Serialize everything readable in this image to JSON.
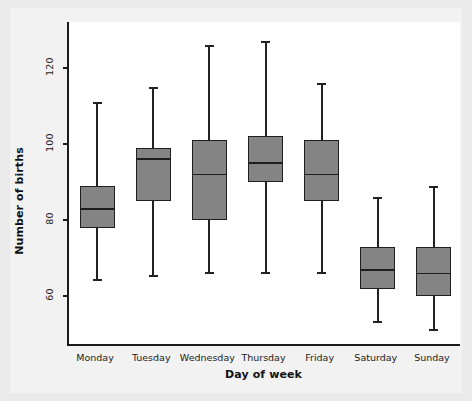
{
  "chart_data": {
    "type": "box",
    "title": "",
    "xlabel": "Day of week",
    "ylabel": "Number of births",
    "categories": [
      "Monday",
      "Tuesday",
      "Wednesday",
      "Thursday",
      "Friday",
      "Saturday",
      "Sunday"
    ],
    "y_ticks": [
      60,
      80,
      100,
      120
    ],
    "ylim": [
      47,
      132
    ],
    "grid": false,
    "legend": null,
    "box_fill_color": "#848484",
    "box_line_color": "#1f1f1f",
    "plot_background": "#ffffff",
    "figure_background": "#eaeaea",
    "boxes": [
      {
        "category": "Monday",
        "whisker_low": 64,
        "q1": 78,
        "median": 83,
        "q3": 89,
        "whisker_high": 111
      },
      {
        "category": "Tuesday",
        "whisker_low": 65,
        "q1": 85,
        "median": 96,
        "q3": 99,
        "whisker_high": 115
      },
      {
        "category": "Wednesday",
        "whisker_low": 66,
        "q1": 80,
        "median": 92,
        "q3": 101,
        "whisker_high": 126
      },
      {
        "category": "Thursday",
        "whisker_low": 66,
        "q1": 90,
        "median": 95,
        "q3": 102,
        "whisker_high": 127
      },
      {
        "category": "Friday",
        "whisker_low": 66,
        "q1": 85,
        "median": 92,
        "q3": 101,
        "whisker_high": 116
      },
      {
        "category": "Saturday",
        "whisker_low": 53,
        "q1": 62,
        "median": 67,
        "q3": 73,
        "whisker_high": 86
      },
      {
        "category": "Sunday",
        "whisker_low": 51,
        "q1": 60,
        "median": 66,
        "q3": 73,
        "whisker_high": 89
      }
    ]
  },
  "axes": {
    "y_title": "Number of births",
    "x_title": "Day of week",
    "y_tick_labels": [
      "60",
      "80",
      "100",
      "120"
    ],
    "x_tick_labels": [
      "Monday",
      "Tuesday",
      "Wednesday",
      "Thursday",
      "Friday",
      "Saturday",
      "Sunday"
    ]
  }
}
